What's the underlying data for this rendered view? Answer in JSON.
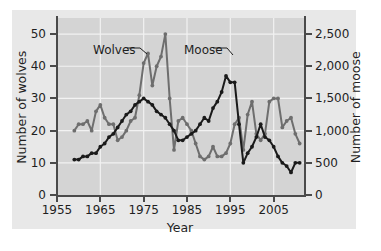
{
  "chart_data": {
    "type": "line",
    "title": "",
    "xlabel": "Year",
    "ylabel": "Number of wolves",
    "ylabel_right": "Number of moose",
    "xlim": [
      1955,
      2012
    ],
    "ylim": [
      0,
      55
    ],
    "ylim_right": [
      0,
      2750
    ],
    "grid": true,
    "legend_position": "inline-annotations",
    "xticks": [
      "1955",
      "1965",
      "1975",
      "1985",
      "1995",
      "2005"
    ],
    "xtick_values": [
      1955,
      1965,
      1975,
      1985,
      1995,
      2005
    ],
    "yticks_left": [
      "0",
      "10",
      "20",
      "30",
      "40",
      "50"
    ],
    "ytick_values_left": [
      0,
      10,
      20,
      30,
      40,
      50
    ],
    "yticks_right": [
      "0",
      "500",
      "1,000",
      "1,500",
      "2,000",
      "2,500"
    ],
    "ytick_values_right": [
      0,
      500,
      1000,
      1500,
      2000,
      2500
    ],
    "annotations": [
      {
        "text": "Wolves",
        "points_to_series": "Wolves"
      },
      {
        "text": "Moose",
        "points_to_series": "Moose"
      }
    ],
    "series": [
      {
        "name": "Wolves",
        "color": "#6e6e6e",
        "axis": "left",
        "unit": "number of wolves",
        "x": [
          1959,
          1960,
          1961,
          1962,
          1963,
          1964,
          1965,
          1966,
          1967,
          1968,
          1969,
          1970,
          1971,
          1972,
          1973,
          1974,
          1975,
          1976,
          1977,
          1978,
          1979,
          1980,
          1981,
          1982,
          1983,
          1984,
          1985,
          1986,
          1987,
          1988,
          1989,
          1990,
          1991,
          1992,
          1993,
          1994,
          1995,
          1996,
          1997,
          1998,
          1999,
          2000,
          2001,
          2002,
          2003,
          2004,
          2005,
          2006,
          2007,
          2008,
          2009,
          2010,
          2011
        ],
        "values": [
          20,
          22,
          22,
          23,
          20,
          26,
          28,
          24,
          22,
          22,
          17,
          18,
          20,
          23,
          24,
          31,
          41,
          44,
          34,
          40,
          43,
          50,
          30,
          14,
          23,
          24,
          22,
          20,
          16,
          12,
          11,
          12,
          15,
          12,
          12,
          13,
          16,
          22,
          24,
          14,
          25,
          29,
          19,
          17,
          19,
          29,
          30,
          30,
          21,
          23,
          24,
          19,
          16
        ]
      },
      {
        "name": "Moose",
        "color": "#1a1a1a",
        "axis": "right",
        "unit": "number of moose",
        "x": [
          1959,
          1960,
          1961,
          1962,
          1963,
          1964,
          1965,
          1966,
          1967,
          1968,
          1969,
          1970,
          1971,
          1972,
          1973,
          1974,
          1975,
          1976,
          1977,
          1978,
          1979,
          1980,
          1981,
          1982,
          1983,
          1984,
          1985,
          1986,
          1987,
          1988,
          1989,
          1990,
          1991,
          1992,
          1993,
          1994,
          1995,
          1996,
          1997,
          1998,
          1999,
          2000,
          2001,
          2002,
          2003,
          2004,
          2005,
          2006,
          2007,
          2008,
          2009,
          2010,
          2011
        ],
        "values_left_scale": [
          11,
          11,
          12,
          12,
          13,
          13,
          15,
          16,
          18,
          19,
          21,
          23,
          25,
          26,
          28,
          29,
          30,
          29,
          28,
          26,
          25,
          24,
          22,
          20,
          17,
          17,
          18,
          19,
          20,
          22,
          24,
          23,
          27,
          29,
          32,
          37,
          35,
          35,
          22,
          10,
          13,
          15,
          18,
          22,
          18,
          17,
          15,
          12,
          10,
          9,
          7,
          10,
          10
        ],
        "values_moose": [
          550,
          560,
          600,
          620,
          650,
          670,
          750,
          800,
          900,
          960,
          1060,
          1130,
          1250,
          1300,
          1400,
          1460,
          1500,
          1440,
          1380,
          1310,
          1260,
          1200,
          1100,
          1000,
          840,
          850,
          900,
          930,
          1000,
          1100,
          1180,
          1150,
          1340,
          1450,
          1600,
          1850,
          1760,
          1760,
          1100,
          500,
          640,
          740,
          900,
          1090,
          880,
          860,
          750,
          580,
          500,
          460,
          360,
          500,
          500
        ]
      }
    ]
  },
  "axes": {
    "left_title": "Number of wolves",
    "right_title": "Number of moose",
    "x_title": "Year"
  },
  "colors": {
    "figure_background": "#ffffff",
    "panel_background": "#e8e8e8",
    "plot_background": "#d4d4d4",
    "gridline": "#f2f2f2",
    "axis": "#4a4a4a",
    "text": "#1f1f1f",
    "wolves": "#6e6e6e",
    "moose": "#1a1a1a"
  }
}
